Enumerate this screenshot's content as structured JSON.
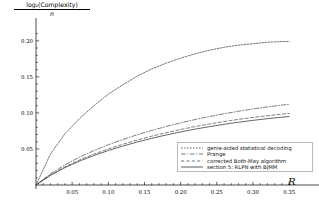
{
  "axes": {
    "ylabel_numerator": "log₂(Complexity)",
    "ylabel_denominator": "n",
    "xlabel": "R",
    "x_ticks": [
      "0.05",
      "0.10",
      "0.15",
      "0.20",
      "0.25",
      "0.30",
      "0.35"
    ],
    "y_ticks": [
      "0.05",
      "0.10",
      "0.15",
      "0.20"
    ]
  },
  "legend": {
    "entries": [
      {
        "label": "genie-aided statistical decoding",
        "style": "dotted",
        "color": "#444444"
      },
      {
        "label": "Prange",
        "style": "dashdot",
        "color": "#555555"
      },
      {
        "label": "corrected Both-May algorithm",
        "style": "dashed",
        "color": "#555555"
      },
      {
        "label": "section 5: RLPN with BJMM",
        "style": "solid",
        "color": "#333333"
      }
    ]
  },
  "chart_data": {
    "type": "line",
    "title": "",
    "xlabel": "R",
    "ylabel": "log2(Complexity)/n",
    "xlim": [
      0.0,
      0.365
    ],
    "ylim": [
      0.0,
      0.215
    ],
    "grid": false,
    "legend_position": "bottom-right",
    "x": [
      0.0,
      0.02,
      0.04,
      0.06,
      0.08,
      0.1,
      0.12,
      0.14,
      0.16,
      0.18,
      0.2,
      0.22,
      0.24,
      0.26,
      0.28,
      0.3,
      0.32,
      0.34,
      0.35
    ],
    "series": [
      {
        "name": "genie-aided statistical decoding",
        "style": "dotted",
        "values": [
          0.0,
          0.043,
          0.071,
          0.092,
          0.11,
          0.126,
          0.139,
          0.151,
          0.161,
          0.169,
          0.176,
          0.182,
          0.187,
          0.191,
          0.194,
          0.196,
          0.198,
          0.199,
          0.199
        ]
      },
      {
        "name": "Prange",
        "style": "dashdot",
        "values": [
          0.0,
          0.0155,
          0.028,
          0.0385,
          0.0477,
          0.0558,
          0.0631,
          0.0697,
          0.0757,
          0.0812,
          0.0862,
          0.0908,
          0.095,
          0.0988,
          0.1023,
          0.1055,
          0.1083,
          0.1108,
          0.112
        ]
      },
      {
        "name": "corrected Both-May algorithm",
        "style": "dashed",
        "values": [
          0.0,
          0.014,
          0.0252,
          0.0346,
          0.0428,
          0.05,
          0.0565,
          0.0624,
          0.0677,
          0.0725,
          0.077,
          0.081,
          0.0847,
          0.088,
          0.091,
          0.0937,
          0.0961,
          0.0983,
          0.0993
        ]
      },
      {
        "name": "section 5: RLPN with BJMM",
        "style": "solid",
        "values": [
          0.0,
          0.0134,
          0.0241,
          0.0331,
          0.0409,
          0.0478,
          0.054,
          0.0596,
          0.0647,
          0.0694,
          0.0736,
          0.0775,
          0.081,
          0.0842,
          0.0871,
          0.0897,
          0.092,
          0.0941,
          0.095
        ]
      }
    ]
  }
}
